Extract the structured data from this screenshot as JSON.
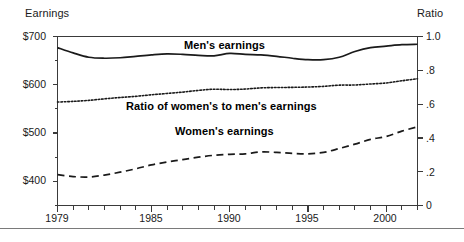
{
  "chart_data": {
    "type": "line",
    "title": "",
    "xlabel": "",
    "ylabel": "Earnings",
    "y2label": "Ratio",
    "xlim": [
      1979,
      2002
    ],
    "ylim": [
      350,
      700
    ],
    "y2lim": [
      0,
      1.0
    ],
    "grid": false,
    "legend": "inline-annotations",
    "left_axis": {
      "label": "Earnings",
      "ticks": [
        "$400",
        "$500",
        "$600",
        "$700"
      ],
      "tick_values": [
        400,
        500,
        600,
        700
      ],
      "minor_ticks": [
        350,
        450,
        550,
        650
      ]
    },
    "right_axis": {
      "label": "Ratio",
      "ticks": [
        "0",
        ".2",
        ".4",
        ".6",
        ".8",
        "1.0"
      ],
      "tick_values": [
        0,
        0.2,
        0.4,
        0.6,
        0.8,
        1.0
      ]
    },
    "x_axis": {
      "ticks": [
        "1979",
        "1985",
        "1990",
        "1995",
        "2000"
      ],
      "tick_values": [
        1979,
        1985,
        1990,
        1995,
        2000
      ],
      "minor_tick_values": [
        1980,
        1981,
        1982,
        1983,
        1984,
        1986,
        1987,
        1988,
        1989,
        1991,
        1992,
        1993,
        1994,
        1996,
        1997,
        1998,
        1999,
        2001,
        2002
      ]
    },
    "x": [
      1979,
      1980,
      1981,
      1982,
      1983,
      1984,
      1985,
      1986,
      1987,
      1988,
      1989,
      1990,
      1991,
      1992,
      1993,
      1994,
      1995,
      1996,
      1997,
      1998,
      1999,
      2000,
      2001,
      2002
    ],
    "series": [
      {
        "name": "Men's earnings",
        "style": "solid",
        "axis": "left",
        "values": [
          677,
          666,
          657,
          655,
          656,
          659,
          662,
          664,
          663,
          661,
          660,
          665,
          663,
          662,
          659,
          655,
          652,
          652,
          657,
          669,
          677,
          680,
          683,
          684
        ]
      },
      {
        "name": "Women's earnings",
        "style": "dashed",
        "axis": "left",
        "values": [
          414,
          410,
          409,
          413,
          419,
          426,
          434,
          440,
          445,
          450,
          454,
          456,
          457,
          461,
          460,
          458,
          457,
          460,
          468,
          477,
          487,
          493,
          504,
          513
        ]
      },
      {
        "name": "Ratio of women's to men's earnings",
        "style": "dotted",
        "axis": "right",
        "values": [
          0.612,
          0.616,
          0.622,
          0.631,
          0.639,
          0.646,
          0.655,
          0.663,
          0.671,
          0.681,
          0.688,
          0.686,
          0.689,
          0.696,
          0.698,
          0.699,
          0.701,
          0.705,
          0.712,
          0.713,
          0.719,
          0.725,
          0.738,
          0.75
        ]
      }
    ],
    "annotations": [
      {
        "text": "Men's earnings"
      },
      {
        "text": "Ratio of women's to men's earnings"
      },
      {
        "text": "Women's earnings"
      }
    ]
  },
  "axis_titles": {
    "left": "Earnings",
    "right": "Ratio"
  },
  "labels": {
    "men": "Men's earnings",
    "ratio": "Ratio of women's to men's earnings",
    "women": "Women's earnings"
  },
  "ticks": {
    "left": [
      "$700",
      "$600",
      "$500",
      "$400"
    ],
    "right": [
      "1.0",
      ".8",
      ".6",
      ".4",
      ".2",
      "0"
    ],
    "bottom": [
      "1979",
      "1985",
      "1990",
      "1995",
      "2000"
    ]
  },
  "colors": {
    "line": "#1a1a1a",
    "axis": "#3a3a3a",
    "text": "#1a1a1a",
    "background": "#ffffff",
    "rule": "#7a7a7a"
  }
}
